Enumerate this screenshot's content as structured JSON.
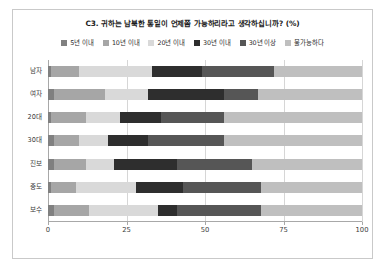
{
  "chart_data": {
    "type": "bar",
    "subtype": "horizontal-stacked-100",
    "title": "C3. 귀하는 남북한 통일이 언제쯤 가능하리라고 생각하십니까? (%)",
    "xlabel": "",
    "ylabel": "",
    "xlim": [
      0,
      100
    ],
    "xticks": [
      0,
      25,
      50,
      75,
      100
    ],
    "grid": true,
    "legend_position": "top",
    "categories": [
      "남자",
      "여자",
      "20대",
      "30대",
      "진보",
      "중도",
      "보수"
    ],
    "series": [
      {
        "name": "5년 이내",
        "color": "#808080",
        "values": [
          1,
          2,
          1,
          2,
          2,
          1,
          2
        ]
      },
      {
        "name": "10년 이내",
        "color": "#a6a6a6",
        "values": [
          9,
          16,
          11,
          8,
          10,
          8,
          11
        ]
      },
      {
        "name": "20년 이내",
        "color": "#d9d9d9",
        "values": [
          23,
          14,
          11,
          9,
          9,
          19,
          22
        ]
      },
      {
        "name": "30년 이내",
        "color": "#2e2e2e",
        "values": [
          16,
          24,
          13,
          13,
          20,
          15,
          6
        ]
      },
      {
        "name": "30년 이상",
        "color": "#565656",
        "values": [
          23,
          11,
          20,
          24,
          24,
          25,
          27
        ]
      },
      {
        "name": "불가능하다",
        "color": "#bfbfbf",
        "values": [
          28,
          33,
          44,
          44,
          35,
          32,
          32
        ]
      }
    ]
  },
  "colors": {
    "background": "#ffffff",
    "border": "#c9c9c9",
    "grid": "#d6d6d6",
    "axis": "#a8a8a8",
    "text": "#2b2b2b"
  }
}
